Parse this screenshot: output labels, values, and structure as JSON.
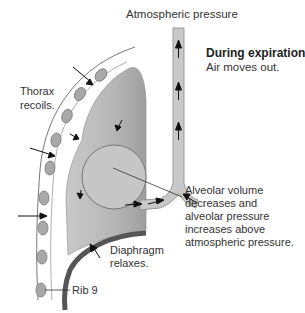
{
  "title": "During expiration",
  "subtitle": "Air moves out.",
  "labels": {
    "atmospheric": "Atmospheric pressure",
    "thorax_line1": "Thorax",
    "thorax_line2": "recoils.",
    "alveolar_lines": [
      "Alveolar volume",
      "decreases and",
      "alveolar pressure",
      "increases above",
      "atmospheric pressure."
    ],
    "diaphragm_line1": "Diaphragm",
    "diaphragm_line2": "relaxes.",
    "rib": "Rib 9"
  },
  "colors": {
    "lung_fill": "#b4b4b4",
    "airway_fill": "#c8c8c8",
    "diaphragm": "#555555",
    "rib_fill": "#a8a8a8",
    "outline": "#666666"
  }
}
